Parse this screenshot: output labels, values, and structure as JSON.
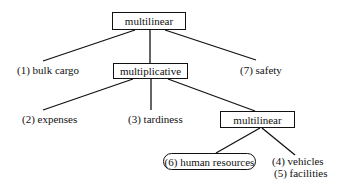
{
  "diagram": {
    "type": "tree",
    "nodes": {
      "root": {
        "label": "multilinear",
        "shape": "box"
      },
      "bulk_cargo": {
        "label": "(1) bulk cargo"
      },
      "multiplicative": {
        "label": "multiplicative",
        "shape": "box"
      },
      "safety": {
        "label": "(7) safety"
      },
      "expenses": {
        "label": "(2) expenses"
      },
      "tardiness": {
        "label": "(3) tardiness"
      },
      "sub_multilinear": {
        "label": "multilinear",
        "shape": "box"
      },
      "human_resources": {
        "label": "(6) human resources",
        "shape": "rounded-box"
      },
      "vehicles": {
        "label": "(4) vehicles"
      },
      "facilities": {
        "label": "(5) facilities"
      }
    },
    "edges": [
      [
        "root",
        "bulk_cargo"
      ],
      [
        "root",
        "multiplicative"
      ],
      [
        "root",
        "safety"
      ],
      [
        "multiplicative",
        "expenses"
      ],
      [
        "multiplicative",
        "tardiness"
      ],
      [
        "multiplicative",
        "sub_multilinear"
      ],
      [
        "sub_multilinear",
        "human_resources"
      ],
      [
        "sub_multilinear",
        "vehicles"
      ]
    ]
  }
}
